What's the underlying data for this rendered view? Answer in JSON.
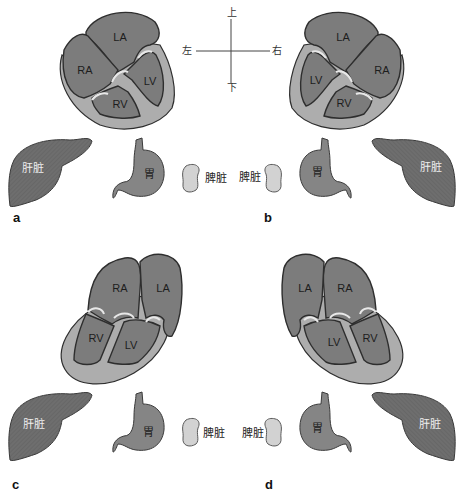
{
  "figure": {
    "colors": {
      "chamber": "#7c7c7c",
      "wall": "#adadad",
      "outline": "#2e2e2e",
      "liver": "#6e6e6e",
      "stomach": "#858585",
      "spleen": "#d2d2d2",
      "text": "#222222"
    },
    "compass": {
      "up": "上",
      "down": "下",
      "left": "左",
      "right": "右"
    },
    "panels": [
      {
        "letter": "a",
        "chambers": {
          "la": "LA",
          "ra": "RA",
          "lv": "LV",
          "rv": "RV"
        },
        "organs": {
          "liver": "肝脏",
          "stomach": "胃",
          "spleen": "脾脏"
        }
      },
      {
        "letter": "b",
        "chambers": {
          "la": "LA",
          "ra": "RA",
          "lv": "LV",
          "rv": "RV"
        },
        "organs": {
          "liver": "肝脏",
          "stomach": "胃",
          "spleen": "脾脏"
        }
      },
      {
        "letter": "c",
        "chambers": {
          "la": "LA",
          "ra": "RA",
          "lv": "LV",
          "rv": "RV"
        },
        "organs": {
          "liver": "肝脏",
          "stomach": "胃",
          "spleen": "脾脏"
        }
      },
      {
        "letter": "d",
        "chambers": {
          "la": "LA",
          "ra": "RA",
          "lv": "LV",
          "rv": "RV"
        },
        "organs": {
          "liver": "肝脏",
          "stomach": "胃",
          "spleen": "脾脏"
        }
      }
    ]
  }
}
